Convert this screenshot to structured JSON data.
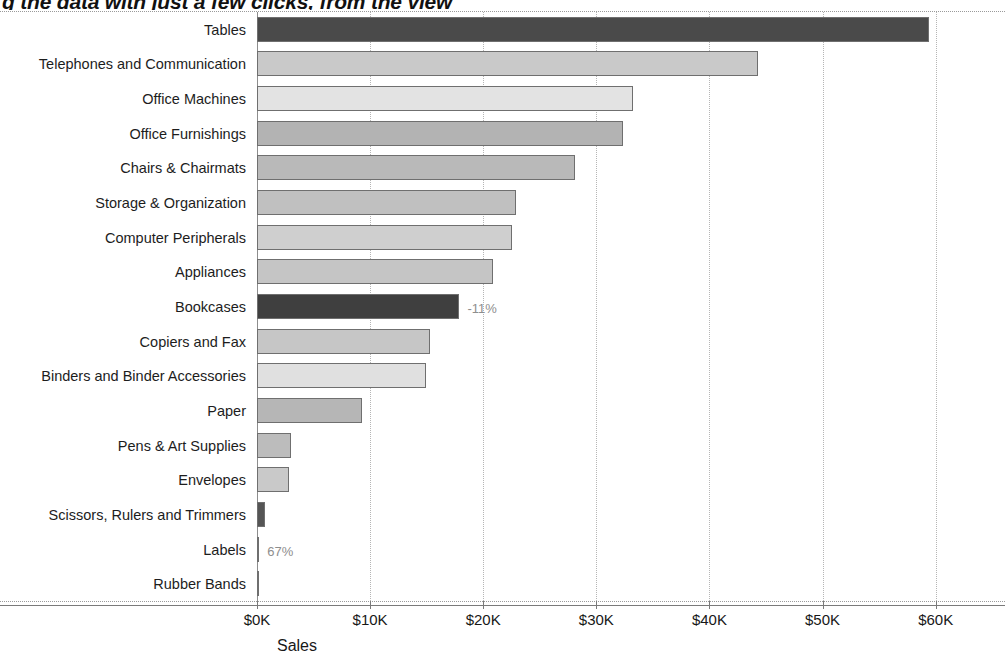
{
  "slide": {
    "title_fragment": "g the data with just a few clicks, from the view"
  },
  "chart_data": {
    "type": "bar",
    "orientation": "horizontal",
    "title": "",
    "xlabel": "Sales",
    "ylabel": "",
    "xlim": [
      0,
      61000
    ],
    "xticks": [
      0,
      10000,
      20000,
      30000,
      40000,
      50000,
      60000
    ],
    "xticklabels": [
      "$0K",
      "$10K",
      "$20K",
      "$30K",
      "$40K",
      "$50K",
      "$60K"
    ],
    "grid": true,
    "grid_axis": "x",
    "legend": false,
    "categories": [
      "Tables",
      "Telephones and Communication",
      "Office Machines",
      "Office Furnishings",
      "Chairs & Chairmats",
      "Storage & Organization",
      "Computer Peripherals",
      "Appliances",
      "Bookcases",
      "Copiers and Fax",
      "Binders and Binder Accessories",
      "Paper",
      "Pens & Art Supplies",
      "Envelopes",
      "Scissors, Rulers and Trimmers",
      "Labels",
      "Rubber Bands"
    ],
    "values": [
      59400,
      44300,
      33200,
      32400,
      28100,
      22900,
      22500,
      20900,
      17900,
      15300,
      14900,
      9300,
      3000,
      2800,
      700,
      200,
      100
    ],
    "bar_colors": [
      "#4a4a4a",
      "#c9c9c9",
      "#e3e3e3",
      "#b3b3b3",
      "#b9b9b9",
      "#c0c0c0",
      "#cfcfcf",
      "#c5c5c5",
      "#3f3f3f",
      "#c6c6c6",
      "#e0e0e0",
      "#b6b6b6",
      "#bcbcbc",
      "#c9c9c9",
      "#555555",
      "#cdcdcd",
      "#d6d6d6"
    ],
    "annotations": [
      {
        "category": "Bookcases",
        "text": "-11%"
      },
      {
        "category": "Labels",
        "text": "67%"
      }
    ]
  }
}
